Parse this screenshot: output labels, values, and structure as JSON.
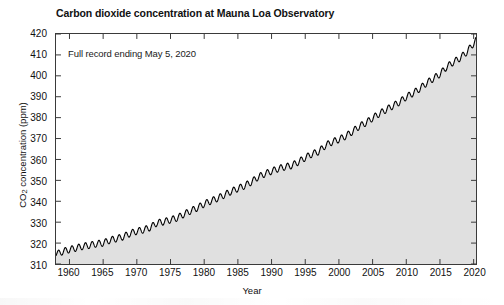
{
  "chart_data": {
    "type": "line",
    "title": "Carbon dioxide concentration at Mauna Loa Observatory",
    "xlabel": "Year",
    "ylabel": "CO2 concentration (ppm)",
    "ylabel_parts": {
      "prefix": "CO",
      "sub": "2",
      "suffix": " concentration (ppm)"
    },
    "annotation": "Full record ending May 5, 2020",
    "xlim": [
      1958,
      2020.35
    ],
    "ylim": [
      310,
      420
    ],
    "xticks": [
      1960,
      1965,
      1970,
      1975,
      1980,
      1985,
      1990,
      1995,
      2000,
      2005,
      2010,
      2015,
      2020
    ],
    "yticks": [
      310,
      320,
      330,
      340,
      350,
      360,
      370,
      380,
      390,
      400,
      410,
      420
    ],
    "grid": false,
    "legend": null,
    "fill_under_curve": true,
    "fill_color": "#e0e0e0",
    "line_color": "#000000",
    "line_width": 1.1,
    "seasonal_amplitude_ppm": 3.1,
    "seasonal_peak_month": 5,
    "series": [
      {
        "name": "Monthly mean CO2 (ppm)",
        "description": "Keeling curve: annual-mean trend with superimposed seasonal cycle",
        "x": [
          1958.3,
          1959,
          1960,
          1961,
          1962,
          1963,
          1964,
          1965,
          1966,
          1967,
          1968,
          1969,
          1970,
          1971,
          1972,
          1973,
          1974,
          1975,
          1976,
          1977,
          1978,
          1979,
          1980,
          1981,
          1982,
          1983,
          1984,
          1985,
          1986,
          1987,
          1988,
          1989,
          1990,
          1991,
          1992,
          1993,
          1994,
          1995,
          1996,
          1997,
          1998,
          1999,
          2000,
          2001,
          2002,
          2003,
          2004,
          2005,
          2006,
          2007,
          2008,
          2009,
          2010,
          2011,
          2012,
          2013,
          2014,
          2015,
          2016,
          2017,
          2018,
          2019,
          2020.35
        ],
        "annual_mean": [
          315.0,
          315.98,
          316.91,
          317.64,
          318.45,
          318.99,
          319.62,
          320.04,
          321.38,
          322.16,
          323.04,
          324.62,
          325.68,
          326.32,
          327.45,
          329.68,
          330.18,
          331.11,
          332.04,
          333.83,
          335.4,
          336.84,
          338.75,
          340.11,
          341.45,
          343.05,
          344.65,
          346.12,
          347.42,
          349.19,
          351.57,
          353.12,
          354.39,
          355.61,
          356.45,
          357.1,
          358.83,
          360.82,
          362.61,
          363.73,
          366.7,
          368.38,
          369.55,
          371.14,
          373.28,
          375.8,
          377.52,
          379.8,
          381.9,
          383.79,
          385.6,
          387.43,
          389.9,
          391.65,
          393.85,
          396.52,
          398.65,
          400.83,
          404.24,
          406.55,
          408.52,
          411.44,
          417.0
        ]
      }
    ]
  },
  "axes": {
    "y_tick_labels": [
      "420",
      "410",
      "400",
      "390",
      "380",
      "370",
      "360",
      "350",
      "340",
      "330",
      "320",
      "310"
    ],
    "x_tick_labels": [
      "1960",
      "1965",
      "1970",
      "1975",
      "1980",
      "1985",
      "1990",
      "1995",
      "2000",
      "2005",
      "2010",
      "2015",
      "2020"
    ]
  }
}
